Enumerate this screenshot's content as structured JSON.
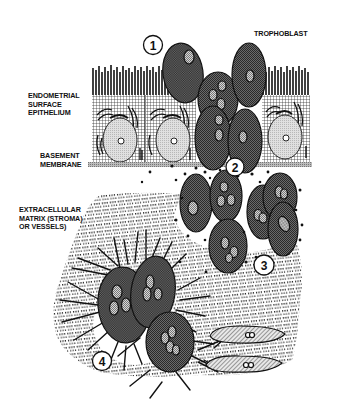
{
  "labels": {
    "trophoblast": "TROPHOBLAST",
    "epithelium": [
      "ENDOMETRIAL",
      "SURFACE",
      "EPITHELIUM"
    ],
    "basement": [
      "BASEMENT",
      "MEMBRANE"
    ],
    "matrix": [
      "EXTRACELLULAR",
      "MATRIX (STROMA)",
      "OR VESSELS)"
    ]
  },
  "steps": [
    {
      "number": "1",
      "stage": "trophoblast-attachment"
    },
    {
      "number": "2",
      "stage": "basement-membrane-penetration"
    },
    {
      "number": "3",
      "stage": "matrix-invasion"
    },
    {
      "number": "4",
      "stage": "stromal-interaction"
    }
  ],
  "colors": {
    "ink": "#111111",
    "trophoblast_fill": "#5a5a5a",
    "nucleus_fill": "#a8a8a8",
    "epithelial_nucleus": "#cfcfcf",
    "membrane": "#9a9a9a"
  }
}
